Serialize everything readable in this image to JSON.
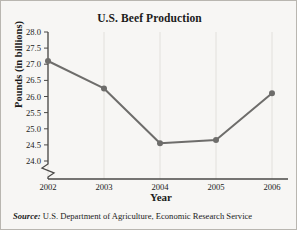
{
  "chart_data": {
    "type": "line",
    "title": "U.S. Beef Production",
    "xlabel": "Year",
    "ylabel": "Pounds (in billions)",
    "categories": [
      "2002",
      "2003",
      "2004",
      "2005",
      "2006"
    ],
    "x": [
      2002,
      2003,
      2004,
      2005,
      2006
    ],
    "values": [
      27.1,
      26.25,
      24.55,
      24.65,
      26.1
    ],
    "series": [
      {
        "name": "U.S. Beef Production",
        "values": [
          27.1,
          26.25,
          24.55,
          24.65,
          26.1
        ]
      }
    ],
    "xlim": [
      2002,
      2006
    ],
    "ylim": [
      24.0,
      28.0
    ],
    "ytick_labels": [
      "28.0",
      "27.5",
      "27.0",
      "26.5",
      "26.0",
      "25.5",
      "25.0",
      "24.5",
      "24.0"
    ],
    "ytick_values": [
      28.0,
      27.5,
      27.0,
      26.5,
      26.0,
      25.5,
      25.0,
      24.5,
      24.0
    ],
    "xtick_labels": [
      "2002",
      "2003",
      "2004",
      "2005",
      "2006"
    ],
    "grid": "vertical-only",
    "legend": "none",
    "axis_break": "y-axis broken below 24.0",
    "line_color": "#6e6d6b",
    "marker_color": "#6e6d6b",
    "grid_color": "#dedcd8",
    "axis_color": "#4a4947",
    "background_color": "#f7f6f4"
  },
  "source": {
    "label": "Source:",
    "text": "U.S. Department of Agriculture, Economic Research Service"
  }
}
